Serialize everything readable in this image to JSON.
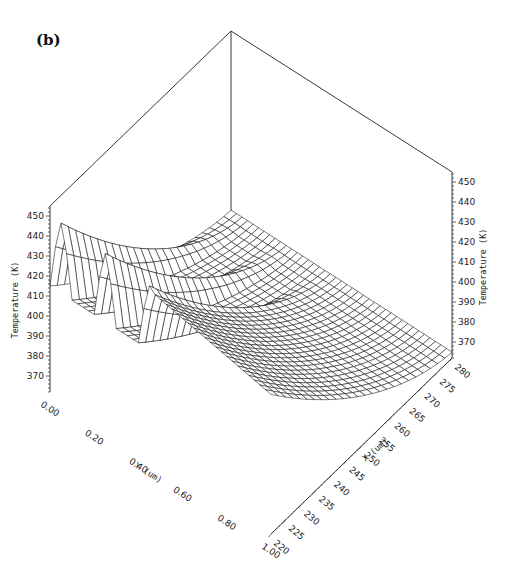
{
  "panel_label": "(b)",
  "chart_data": {
    "type": "surface3d",
    "title": "",
    "panel": "(b)",
    "x_axis": {
      "label": "X (um)",
      "ticks": [
        220,
        225,
        230,
        235,
        240,
        245,
        250,
        255,
        260,
        265,
        270,
        275,
        280
      ],
      "range": [
        220,
        280
      ]
    },
    "y_axis": {
      "label": "Y (um)",
      "ticks": [
        "0.00",
        "0.20",
        "0.40",
        "0.60",
        "0.80",
        "1.00"
      ],
      "range": [
        0,
        1
      ]
    },
    "z_axis": {
      "label": "Temperature (K)",
      "ticks": [
        370,
        380,
        390,
        400,
        410,
        420,
        430,
        440,
        450
      ],
      "range": [
        362,
        455
      ]
    },
    "grid": false,
    "style": "black wireframe mesh on white",
    "mesh": {
      "nx": 25,
      "ny": 40
    },
    "ridges": [
      {
        "y": 0.05,
        "peak_K": 450
      },
      {
        "y": 0.25,
        "peak_K": 449
      },
      {
        "y": 0.45,
        "peak_K": 447
      }
    ],
    "base_K": 365
  },
  "labels": {
    "z_left_title": "Temperature (K)",
    "z_right_title": "Temperature (K)",
    "y_title": "Y (um)",
    "x_title": "X (um)"
  }
}
